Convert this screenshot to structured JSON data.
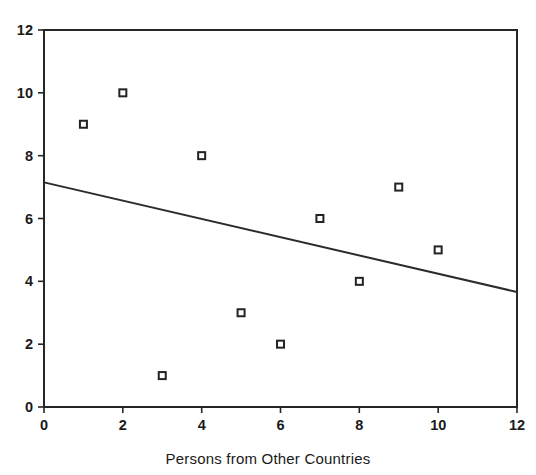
{
  "chart_data": {
    "type": "scatter",
    "title": "",
    "xlabel": "Persons from Other Countries",
    "ylabel": "",
    "xlim": [
      0,
      12
    ],
    "ylim": [
      0,
      12
    ],
    "xticks": [
      "0",
      "2",
      "4",
      "6",
      "8",
      "10",
      "12"
    ],
    "yticks": [
      "0",
      "2",
      "4",
      "6",
      "8",
      "10",
      "12"
    ],
    "grid": false,
    "legend": null,
    "marker_style": "open-square",
    "point_color": "#232323",
    "line_color": "#2b2b2b",
    "frame_color": "#262626",
    "background": "#ffffff",
    "series": [
      {
        "name": "observations",
        "type": "scatter",
        "x": [
          1,
          2,
          3,
          4,
          5,
          6,
          7,
          8,
          9,
          10
        ],
        "y": [
          9,
          10,
          1,
          8,
          3,
          2,
          6,
          4,
          7,
          5
        ]
      },
      {
        "name": "regression-line",
        "type": "line",
        "x": [
          0,
          12
        ],
        "y": [
          7.15,
          3.66
        ]
      }
    ],
    "points": [
      {
        "x": 1,
        "y": 9
      },
      {
        "x": 2,
        "y": 10
      },
      {
        "x": 3,
        "y": 1
      },
      {
        "x": 4,
        "y": 8
      },
      {
        "x": 5,
        "y": 3
      },
      {
        "x": 6,
        "y": 2
      },
      {
        "x": 7,
        "y": 6
      },
      {
        "x": 8,
        "y": 4
      },
      {
        "x": 9,
        "y": 7
      },
      {
        "x": 10,
        "y": 5
      }
    ],
    "trendline": {
      "x_start": 0,
      "y_start": 7.15,
      "x_end": 12,
      "y_end": 3.66,
      "slope": -0.291,
      "intercept": 7.15,
      "direction": "negative"
    }
  }
}
